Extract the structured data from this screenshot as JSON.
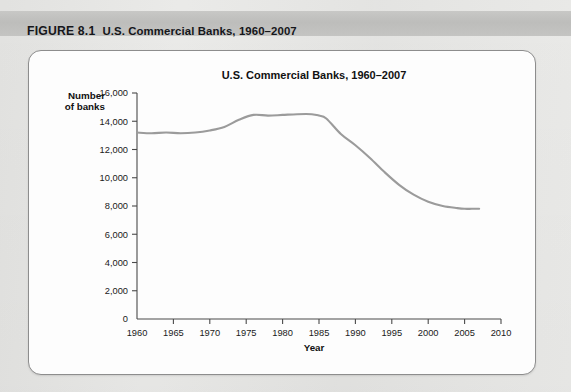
{
  "figure": {
    "number_label": "FIGURE 8.1",
    "caption": "U.S. Commercial Banks, 1960–2007"
  },
  "chart_data": {
    "type": "line",
    "title": "U.S. Commercial Banks, 1960–2007",
    "xlabel": "Year",
    "ylabel_line1": "Number",
    "ylabel_line2": "of banks",
    "xlim": [
      1960,
      2010
    ],
    "ylim": [
      0,
      16000
    ],
    "grid": false,
    "legend": null,
    "line_color": "#9b9b9b",
    "xticks": [
      1960,
      1965,
      1970,
      1975,
      1980,
      1985,
      1990,
      1995,
      2000,
      2005,
      2010
    ],
    "xtick_labels": [
      "1960",
      "1965",
      "1970",
      "1975",
      "1980",
      "1985",
      "1990",
      "1995",
      "2000",
      "2005",
      "2010"
    ],
    "yticks": [
      0,
      2000,
      4000,
      6000,
      8000,
      10000,
      12000,
      14000,
      16000
    ],
    "ytick_labels": [
      "0",
      "2,000",
      "4,000",
      "6,000",
      "8,000",
      "10,000",
      "12,000",
      "14,000",
      "16,000"
    ],
    "series": [
      {
        "name": "U.S. Commercial Banks",
        "x": [
          1960,
          1962,
          1964,
          1966,
          1968,
          1970,
          1972,
          1974,
          1976,
          1978,
          1980,
          1982,
          1984,
          1985,
          1986,
          1988,
          1990,
          1992,
          1994,
          1996,
          1998,
          2000,
          2002,
          2004,
          2005,
          2006,
          2007
        ],
        "values": [
          13200,
          13150,
          13200,
          13150,
          13200,
          13350,
          13600,
          14100,
          14450,
          14400,
          14450,
          14500,
          14500,
          14400,
          14200,
          13100,
          12300,
          11400,
          10400,
          9500,
          8800,
          8300,
          8000,
          7850,
          7800,
          7800,
          7800
        ]
      }
    ]
  }
}
